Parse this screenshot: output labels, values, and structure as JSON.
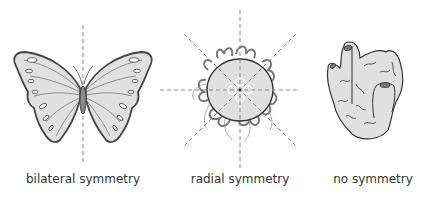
{
  "diagram": {
    "panels": [
      {
        "id": "butterfly",
        "caption": "bilateral symmetry",
        "center_x": 83
      },
      {
        "id": "jellyfish",
        "caption": "radial symmetry",
        "center_x": 240
      },
      {
        "id": "sponge",
        "caption": "no symmetry",
        "center_x": 373
      }
    ]
  },
  "colors": {
    "fill": "#e0e0e0",
    "stroke": "#444444",
    "axis": "#888888",
    "body": "#8a8a8a"
  }
}
